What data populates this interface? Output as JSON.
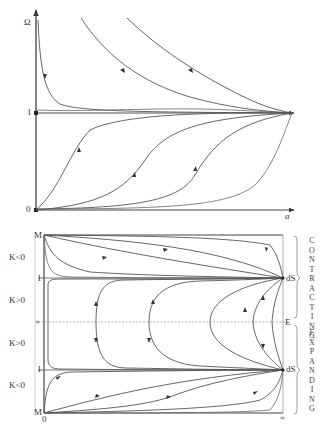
{
  "top_panel": {
    "y_axis_label": "Ω",
    "x_axis_label": "a",
    "tick_one": "1",
    "tick_zero": "0"
  },
  "bottom_panel": {
    "labels_left": {
      "m_top": "M",
      "k_neg_top": "K<0",
      "one_top": "1",
      "k_pos_top": "K>0",
      "infinity": "∞",
      "k_pos_bottom": "K>0",
      "one_bottom": "1",
      "k_neg_bottom": "K<0",
      "m_bottom": "M",
      "zero": "0"
    },
    "labels_right": {
      "ds_top": "dS",
      "e": "E",
      "ds_bottom": "dS",
      "infinity": "∞"
    },
    "phase_labels": {
      "contracting": "CONTRACTING",
      "expanding": "EXPANDING"
    }
  },
  "colors": {
    "line": "#555555",
    "axis": "#333333",
    "grid": "#999999"
  }
}
